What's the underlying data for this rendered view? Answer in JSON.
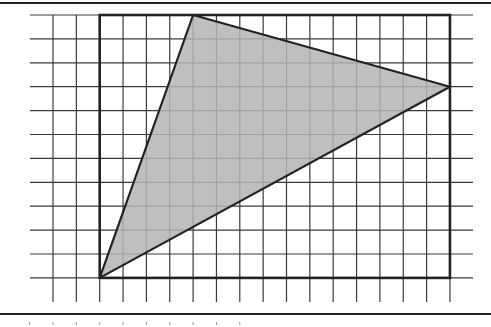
{
  "figure": {
    "colors": {
      "grid": "#3a3a3a",
      "border": "#222222",
      "fill": "#b4b4b4",
      "background": "#ffffff"
    },
    "grid": {
      "columns": 17,
      "rows": 11,
      "x0": 53,
      "y0": 15,
      "cell_w": 23.35,
      "cell_h": 23.9,
      "h_line_x_start": 30,
      "h_line_x_end": 473,
      "v_line_y_end": 302
    },
    "rectangle": {
      "col_start": 2,
      "col_end": 17,
      "row_start": 0,
      "row_end": 11
    },
    "triangle": {
      "vertices_grid": [
        [
          2,
          11
        ],
        [
          6,
          0
        ],
        [
          17,
          3
        ]
      ],
      "label": "shaded triangle"
    },
    "frame": {
      "top_y": 3,
      "bottom_y": 314
    }
  }
}
